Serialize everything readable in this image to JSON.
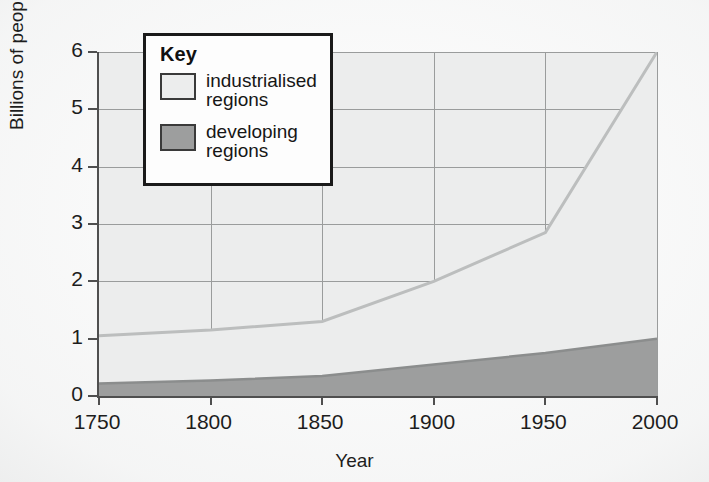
{
  "figure": {
    "type": "stacked-area-line-chart",
    "background_color": "#ffffff",
    "plot_background_color": "#eceded"
  },
  "axes": {
    "y_title": "Billions of people",
    "x_title": "Year",
    "y_ticks": [
      "0",
      "1",
      "2",
      "3",
      "4",
      "5",
      "6"
    ],
    "x_ticks": [
      "1750",
      "1800",
      "1850",
      "1900",
      "1950",
      "2000"
    ]
  },
  "legend": {
    "title": "Key",
    "items": [
      {
        "label_line1": "industrialised",
        "label_line2": "regions",
        "swatch_color": "#eceded",
        "swatch_border": "#3a3a3a"
      },
      {
        "label_line1": "developing",
        "label_line2": "regions",
        "swatch_color": "#9d9e9e",
        "swatch_border": "#3a3a3a"
      }
    ]
  },
  "chart_data": {
    "type": "area",
    "title": "",
    "xlabel": "Year",
    "ylabel": "Billions of people",
    "xlim": [
      1750,
      2000
    ],
    "ylim": [
      0,
      6
    ],
    "grid": true,
    "legend_position": "inside-top-left",
    "stacked": true,
    "x": [
      1750,
      1800,
      1850,
      1900,
      1950,
      2000
    ],
    "x_tick_labels": [
      "1750",
      "1800",
      "1850",
      "1900",
      "1950",
      "2000"
    ],
    "y_tick_labels": [
      "0",
      "1",
      "2",
      "3",
      "4",
      "5",
      "6"
    ],
    "series": [
      {
        "name": "developing regions",
        "color": "#9d9e9e",
        "line_color": "#8a8c8c",
        "values": [
          0.22,
          0.27,
          0.35,
          0.55,
          0.75,
          1.0
        ]
      },
      {
        "name": "industrialised regions",
        "color": "#eceded",
        "line_color": "#b9bbbb",
        "values": [
          0.83,
          0.88,
          0.95,
          1.45,
          2.1,
          5.0
        ]
      }
    ],
    "cumulative_total": {
      "name": "total (developing + industrialised)",
      "values": [
        1.05,
        1.15,
        1.3,
        2.0,
        2.85,
        6.0
      ]
    },
    "annotations": []
  }
}
